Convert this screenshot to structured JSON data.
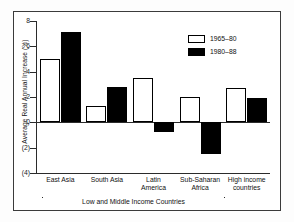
{
  "chart_data": {
    "type": "bar",
    "title": "",
    "xlabel": "",
    "ylabel": "Average Real Annual Increase (%)",
    "categories": [
      "East Asia",
      "South Asia",
      "Latin America",
      "Sub-Saharan Africa",
      "High income countries"
    ],
    "category_lines": [
      [
        "East Asia"
      ],
      [
        "South Asia"
      ],
      [
        "Latin",
        "America"
      ],
      [
        "Sub-Saharan",
        "Africa"
      ],
      [
        "High income",
        "countries"
      ]
    ],
    "series": [
      {
        "name": "1965–80",
        "values": [
          5.0,
          1.3,
          3.5,
          2.0,
          2.7
        ],
        "color": "#ffffff"
      },
      {
        "name": "1980–88",
        "values": [
          7.1,
          2.8,
          -0.8,
          -2.5,
          1.95
        ],
        "color": "#000000"
      }
    ],
    "ylim": [
      -4,
      8
    ],
    "yticks": [
      8,
      6,
      4,
      2,
      0,
      -2,
      -4
    ],
    "ytick_labels": [
      "8",
      "6",
      "4",
      "2",
      "0",
      "(2)",
      "(4)"
    ],
    "grid": false,
    "legend_position": "upper right",
    "annotations": [
      {
        "name": "group-bracket",
        "text": "Low and Middle Income Countries",
        "spans": [
          "East Asia",
          "South Asia",
          "Latin America",
          "Sub-Saharan Africa"
        ]
      }
    ]
  },
  "legend": {
    "entries": [
      {
        "label": "1965–80",
        "style": "light"
      },
      {
        "label": "1980–88",
        "style": "dark"
      }
    ]
  },
  "axis": {
    "y_title": "Average Real Annual Increase (%)",
    "tick_labels": [
      "8",
      "6",
      "4",
      "2",
      "0",
      "(2)",
      "(4)"
    ]
  },
  "bracket": {
    "label": "Low and Middle Income Countries"
  }
}
